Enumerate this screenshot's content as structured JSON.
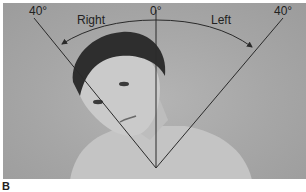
{
  "figure": {
    "panel_label": "B",
    "annotations": {
      "left_limit": "40°",
      "center": "0°",
      "right_limit": "40°",
      "right_direction": "Right",
      "left_direction": "Left"
    },
    "colors": {
      "background": "#a8a8a8",
      "lines": "#2a2a2a",
      "text": "#222222"
    }
  }
}
